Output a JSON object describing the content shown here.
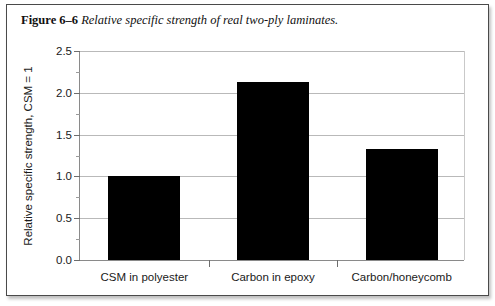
{
  "figure": {
    "caption_label": "Figure 6–6",
    "caption_text": "Relative specific strength of real two-ply laminates."
  },
  "chart_data": {
    "type": "bar",
    "title": "",
    "subtitle": "",
    "xlabel": "",
    "ylabel": "Relative specific strength, CSM = 1",
    "categories": [
      "CSM in polyester",
      "Carbon in epoxy",
      "Carbon/honeycomb"
    ],
    "values": [
      1.0,
      2.13,
      1.33
    ],
    "ylim": [
      0.0,
      2.5
    ],
    "ytick_values": [
      0.0,
      0.5,
      1.0,
      1.5,
      2.0,
      2.5
    ],
    "ytick_labels": [
      "0.0",
      "0.5",
      "1.0",
      "1.5",
      "2.0",
      "2.5"
    ],
    "yminor_values": [
      0.25,
      0.75,
      1.25,
      1.75,
      2.25
    ],
    "grid": true,
    "grid_axis": "y",
    "legend": false,
    "legend_position": "none",
    "bar_color": "#000000",
    "grid_color": "#b9b9b9",
    "axis_color": "#8a8a8a",
    "text_color": "#1a1a1a",
    "bar_width_fraction": 0.56
  }
}
